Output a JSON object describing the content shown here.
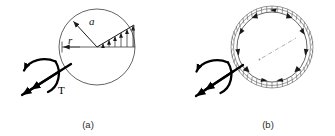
{
  "figure": {
    "background_color": "#ffffff",
    "ink_color": "#1a1a1a",
    "panels": [
      {
        "id": "a",
        "caption": "(a)",
        "description": "Solid circular shaft cross-section with linear shear stress distribution",
        "center": {
          "x": 97,
          "y": 47
        },
        "radius": 38,
        "labels": {
          "outer_radius": "a",
          "inner_radius": "r",
          "torque": "T"
        },
        "stress_arrow_count": 6,
        "torque": {
          "label": "T",
          "sense": "counterclockwise",
          "arrow_style": "double-headed-vector-with-curved-arc"
        }
      },
      {
        "id": "b",
        "caption": "(b)",
        "description": "Thin-walled circular tube cross-section with uniform shear flow around the wall",
        "center": {
          "x": 272,
          "y": 47
        },
        "outer_radius": 41,
        "inner_radius": 35,
        "labels": {
          "torque": ""
        },
        "shear_arrow_count": 12,
        "wall_tick_count": 48,
        "torque": {
          "label": "",
          "sense": "counterclockwise",
          "arrow_style": "double-headed-vector-with-curved-arc"
        }
      }
    ],
    "captions": {
      "panel_a": "(a)",
      "panel_b": "(b)"
    }
  }
}
